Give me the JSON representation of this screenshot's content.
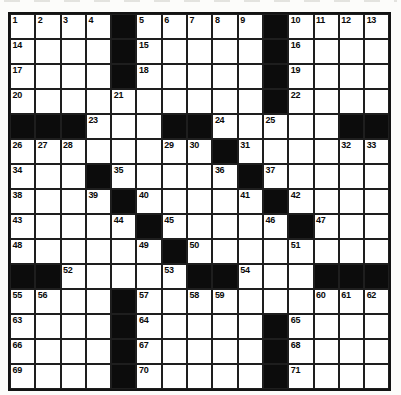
{
  "page": {
    "background_color": "#fcfcfa"
  },
  "puzzle": {
    "kind": "crossword",
    "rows": 15,
    "cols": 15,
    "colors": {
      "white_cell": "#ffffff",
      "black_cell": "#0c0c0c",
      "grid_line": "#1e1e1e",
      "number_text": "#0a0a0a"
    },
    "layout": [
      "....#.....#....",
      "....#.....#....",
      "....#.....#....",
      "..........#....",
      "###...##.....##",
      "........#......",
      "...#.....#.....",
      "....#.....#....",
      ".....#.....#...",
      "......#........",
      "##.....##...###",
      "....#..........",
      "....#.....#....",
      "....#.....#....",
      "....#.....#...."
    ],
    "numbers": [
      [
        1,
        1,
        "1"
      ],
      [
        1,
        2,
        "2"
      ],
      [
        1,
        3,
        "3"
      ],
      [
        1,
        4,
        "4"
      ],
      [
        1,
        6,
        "5"
      ],
      [
        1,
        7,
        "6"
      ],
      [
        1,
        8,
        "7"
      ],
      [
        1,
        9,
        "8"
      ],
      [
        1,
        10,
        "9"
      ],
      [
        1,
        12,
        "10"
      ],
      [
        1,
        13,
        "11"
      ],
      [
        1,
        14,
        "12"
      ],
      [
        1,
        15,
        "13"
      ],
      [
        2,
        1,
        "14"
      ],
      [
        2,
        6,
        "15"
      ],
      [
        2,
        12,
        "16"
      ],
      [
        3,
        1,
        "17"
      ],
      [
        3,
        6,
        "18"
      ],
      [
        3,
        12,
        "19"
      ],
      [
        4,
        1,
        "20"
      ],
      [
        4,
        5,
        "21"
      ],
      [
        4,
        12,
        "22"
      ],
      [
        5,
        4,
        "23"
      ],
      [
        5,
        9,
        "24"
      ],
      [
        5,
        11,
        "25"
      ],
      [
        6,
        1,
        "26"
      ],
      [
        6,
        2,
        "27"
      ],
      [
        6,
        3,
        "28"
      ],
      [
        6,
        7,
        "29"
      ],
      [
        6,
        8,
        "30"
      ],
      [
        6,
        10,
        "31"
      ],
      [
        6,
        14,
        "32"
      ],
      [
        6,
        15,
        "33"
      ],
      [
        7,
        1,
        "34"
      ],
      [
        7,
        5,
        "35"
      ],
      [
        7,
        9,
        "36"
      ],
      [
        7,
        11,
        "37"
      ],
      [
        8,
        1,
        "38"
      ],
      [
        8,
        4,
        "39"
      ],
      [
        8,
        6,
        "40"
      ],
      [
        8,
        10,
        "41"
      ],
      [
        8,
        12,
        "42"
      ],
      [
        9,
        1,
        "43"
      ],
      [
        9,
        5,
        "44"
      ],
      [
        9,
        7,
        "45"
      ],
      [
        9,
        11,
        "46"
      ],
      [
        9,
        13,
        "47"
      ],
      [
        10,
        1,
        "48"
      ],
      [
        10,
        6,
        "49"
      ],
      [
        10,
        8,
        "50"
      ],
      [
        10,
        12,
        "51"
      ],
      [
        11,
        3,
        "52"
      ],
      [
        11,
        7,
        "53"
      ],
      [
        11,
        10,
        "54"
      ],
      [
        12,
        1,
        "55"
      ],
      [
        12,
        2,
        "56"
      ],
      [
        12,
        6,
        "57"
      ],
      [
        12,
        8,
        "58"
      ],
      [
        12,
        9,
        "59"
      ],
      [
        12,
        13,
        "60"
      ],
      [
        12,
        14,
        "61"
      ],
      [
        12,
        15,
        "62"
      ],
      [
        13,
        1,
        "63"
      ],
      [
        13,
        6,
        "64"
      ],
      [
        13,
        12,
        "65"
      ],
      [
        14,
        1,
        "66"
      ],
      [
        14,
        6,
        "67"
      ],
      [
        14,
        12,
        "68"
      ],
      [
        15,
        1,
        "69"
      ],
      [
        15,
        6,
        "70"
      ],
      [
        15,
        12,
        "71"
      ]
    ]
  }
}
